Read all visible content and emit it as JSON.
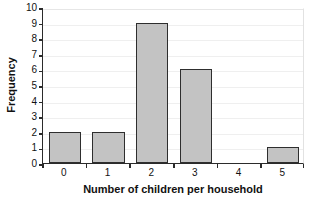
{
  "chart_data": {
    "type": "bar",
    "title": "",
    "subtitle": "",
    "xlabel": "Number of children per household",
    "ylabel": "Frequency",
    "categories": [
      "0",
      "1",
      "2",
      "3",
      "4",
      "5"
    ],
    "values": [
      2,
      2,
      9,
      6,
      0,
      1
    ],
    "series": [
      {
        "name": "Frequency",
        "values": [
          2,
          2,
          9,
          6,
          0,
          1
        ]
      }
    ],
    "ylim": [
      0,
      10
    ],
    "ytick_labels": [
      "0",
      "1",
      "2",
      "3",
      "4",
      "5",
      "6",
      "7",
      "8",
      "9",
      "10"
    ],
    "ytick_values": [
      0,
      1,
      2,
      3,
      4,
      5,
      6,
      7,
      8,
      9,
      10
    ],
    "xtick_labels": [
      "0",
      "1",
      "2",
      "3",
      "4",
      "5"
    ],
    "grid": true,
    "grid_axis": "y",
    "legend": false,
    "legend_position": "none",
    "annotations": [],
    "colors": {
      "bar_fill": "#c3c3c3",
      "bar_edge": "#2e2e2e",
      "axis": "#2b2b2b",
      "gridline": "#efefef",
      "background": "#ffffff",
      "text": "#111111"
    }
  }
}
